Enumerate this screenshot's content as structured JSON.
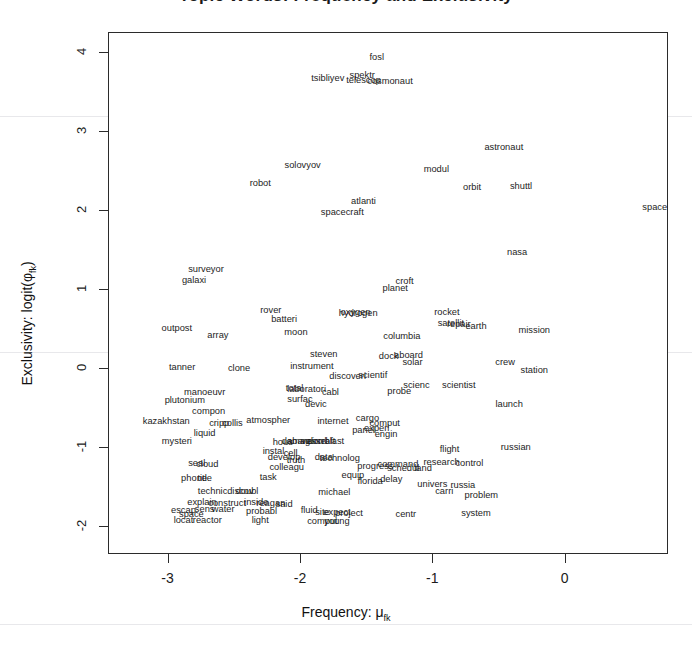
{
  "chart_data": {
    "type": "scatter",
    "title": "Topic Words: Frequency and Exclusivity",
    "xlabel": "Frequency: μ",
    "xlabel_sub": "fk",
    "ylabel": "Exclusivity: logit(φ",
    "ylabel_sub": "fk",
    "ylabel_tail": ")",
    "xlim": [
      -3.45,
      0.78
    ],
    "ylim": [
      -2.35,
      4.25
    ],
    "xticks": [
      "-3",
      "-2",
      "-1",
      "0"
    ],
    "xtick_values": [
      -3,
      -2,
      -1,
      0
    ],
    "yticks": [
      "-2",
      "-1",
      "0",
      "1",
      "2",
      "3",
      "4"
    ],
    "ytick_values": [
      -2,
      -1,
      0,
      1,
      2,
      3,
      4
    ],
    "grid": false,
    "legend": "none",
    "marker": "text-label",
    "points": [
      {
        "label": "fosl",
        "x": -1.42,
        "y": 3.92
      },
      {
        "label": "tsibliyev",
        "x": -1.79,
        "y": 3.65
      },
      {
        "label": "spektr",
        "x": -1.53,
        "y": 3.7
      },
      {
        "label": "telescop",
        "x": -1.52,
        "y": 3.63
      },
      {
        "label": "cosmonaut",
        "x": -1.32,
        "y": 3.62
      },
      {
        "label": "astronaut",
        "x": -0.46,
        "y": 2.78
      },
      {
        "label": "solovyov",
        "x": -1.98,
        "y": 2.55
      },
      {
        "label": "modul",
        "x": -0.97,
        "y": 2.5
      },
      {
        "label": "orbit",
        "x": -0.7,
        "y": 2.28
      },
      {
        "label": "shuttl",
        "x": -0.33,
        "y": 2.29
      },
      {
        "label": "robot",
        "x": -2.3,
        "y": 2.33
      },
      {
        "label": "atlanti",
        "x": -1.52,
        "y": 2.1
      },
      {
        "label": "space",
        "x": 0.68,
        "y": 2.03
      },
      {
        "label": "spacecraft",
        "x": -1.68,
        "y": 1.96
      },
      {
        "label": "nasa",
        "x": -0.36,
        "y": 1.46
      },
      {
        "label": "surveyor",
        "x": -2.71,
        "y": 1.24
      },
      {
        "label": "galaxi",
        "x": -2.8,
        "y": 1.1
      },
      {
        "label": "croft",
        "x": -1.21,
        "y": 1.09
      },
      {
        "label": "planet",
        "x": -1.28,
        "y": 1.0
      },
      {
        "label": "rover",
        "x": -2.22,
        "y": 0.72
      },
      {
        "label": "oxygen",
        "x": -1.58,
        "y": 0.7
      },
      {
        "label": "hydrogen",
        "x": -1.56,
        "y": 0.69
      },
      {
        "label": "rocket",
        "x": -0.89,
        "y": 0.7
      },
      {
        "label": "batteri",
        "x": -2.12,
        "y": 0.61
      },
      {
        "label": "satellit",
        "x": -0.86,
        "y": 0.56
      },
      {
        "label": "repair",
        "x": -0.8,
        "y": 0.55
      },
      {
        "label": "outpost",
        "x": -2.93,
        "y": 0.5
      },
      {
        "label": "earth",
        "x": -0.67,
        "y": 0.52
      },
      {
        "label": "mission",
        "x": -0.23,
        "y": 0.47
      },
      {
        "label": "moon",
        "x": -2.03,
        "y": 0.44
      },
      {
        "label": "array",
        "x": -2.62,
        "y": 0.41
      },
      {
        "label": "columbia",
        "x": -1.23,
        "y": 0.4
      },
      {
        "label": "steven",
        "x": -1.82,
        "y": 0.17
      },
      {
        "label": "dock",
        "x": -1.33,
        "y": 0.14
      },
      {
        "label": "aboard",
        "x": -1.18,
        "y": 0.15
      },
      {
        "label": "solar",
        "x": -1.15,
        "y": 0.06
      },
      {
        "label": "instrument",
        "x": -1.91,
        "y": 0.02
      },
      {
        "label": "crew",
        "x": -0.45,
        "y": 0.07
      },
      {
        "label": "station",
        "x": -0.23,
        "y": -0.03
      },
      {
        "label": "tanner",
        "x": -2.89,
        "y": 0.0
      },
      {
        "label": "clone",
        "x": -2.46,
        "y": -0.01
      },
      {
        "label": "discoveri",
        "x": -1.64,
        "y": -0.11
      },
      {
        "label": "scientif",
        "x": -1.45,
        "y": -0.1
      },
      {
        "label": "scienc",
        "x": -1.12,
        "y": -0.22
      },
      {
        "label": "scientist",
        "x": -0.8,
        "y": -0.22
      },
      {
        "label": "total",
        "x": -2.04,
        "y": -0.27
      },
      {
        "label": "laboratori",
        "x": -1.95,
        "y": -0.28
      },
      {
        "label": "cabl",
        "x": -1.77,
        "y": -0.31
      },
      {
        "label": "probe",
        "x": -1.25,
        "y": -0.3
      },
      {
        "label": "manoeuvr",
        "x": -2.72,
        "y": -0.31
      },
      {
        "label": "plutonium",
        "x": -2.87,
        "y": -0.42
      },
      {
        "label": "surfac",
        "x": -2.0,
        "y": -0.4
      },
      {
        "label": "devic",
        "x": -1.88,
        "y": -0.46
      },
      {
        "label": "launch",
        "x": -0.42,
        "y": -0.47
      },
      {
        "label": "compon",
        "x": -2.69,
        "y": -0.56
      },
      {
        "label": "atmospher",
        "x": -2.24,
        "y": -0.67
      },
      {
        "label": "kazakhstan",
        "x": -3.01,
        "y": -0.68
      },
      {
        "label": "cripp",
        "x": -2.61,
        "y": -0.7
      },
      {
        "label": "collis",
        "x": -2.51,
        "y": -0.7
      },
      {
        "label": "internet",
        "x": -1.75,
        "y": -0.68
      },
      {
        "label": "cargo",
        "x": -1.49,
        "y": -0.64
      },
      {
        "label": "comput",
        "x": -1.36,
        "y": -0.7
      },
      {
        "label": "experi",
        "x": -1.42,
        "y": -0.77
      },
      {
        "label": "panel",
        "x": -1.52,
        "y": -0.8
      },
      {
        "label": "engin",
        "x": -1.35,
        "y": -0.85
      },
      {
        "label": "liquid",
        "x": -2.72,
        "y": -0.83
      },
      {
        "label": "mysteri",
        "x": -2.93,
        "y": -0.94
      },
      {
        "label": "hous",
        "x": -2.13,
        "y": -0.95
      },
      {
        "label": "damag",
        "x": -2.03,
        "y": -0.93
      },
      {
        "label": "abandon",
        "x": -1.96,
        "y": -0.93
      },
      {
        "label": "vessel",
        "x": -1.89,
        "y": -0.93
      },
      {
        "label": "aircraft",
        "x": -1.84,
        "y": -0.94
      },
      {
        "label": "blast",
        "x": -1.74,
        "y": -0.93
      },
      {
        "label": "instal",
        "x": -2.2,
        "y": -1.06
      },
      {
        "label": "cell",
        "x": -2.07,
        "y": -1.08
      },
      {
        "label": "develop",
        "x": -2.12,
        "y": -1.14
      },
      {
        "label": "truth",
        "x": -2.03,
        "y": -1.17
      },
      {
        "label": "data",
        "x": -1.82,
        "y": -1.14
      },
      {
        "label": "technolog",
        "x": -1.7,
        "y": -1.15
      },
      {
        "label": "seal",
        "x": -2.78,
        "y": -1.21
      },
      {
        "label": "cloud",
        "x": -2.7,
        "y": -1.23
      },
      {
        "label": "colleagu",
        "x": -2.1,
        "y": -1.26
      },
      {
        "label": "progress",
        "x": -1.43,
        "y": -1.25
      },
      {
        "label": "command",
        "x": -1.26,
        "y": -1.23
      },
      {
        "label": "schedul",
        "x": -1.22,
        "y": -1.28
      },
      {
        "label": "land",
        "x": -1.07,
        "y": -1.28
      },
      {
        "label": "flight",
        "x": -0.87,
        "y": -1.03
      },
      {
        "label": "russian",
        "x": -0.37,
        "y": -1.01
      },
      {
        "label": "research",
        "x": -0.93,
        "y": -1.2
      },
      {
        "label": "control",
        "x": -0.72,
        "y": -1.21
      },
      {
        "label": "phone",
        "x": -2.8,
        "y": -1.4
      },
      {
        "label": "title",
        "x": -2.72,
        "y": -1.4
      },
      {
        "label": "task",
        "x": -2.24,
        "y": -1.39
      },
      {
        "label": "equip",
        "x": -1.6,
        "y": -1.37
      },
      {
        "label": "florida",
        "x": -1.47,
        "y": -1.44
      },
      {
        "label": "delay",
        "x": -1.31,
        "y": -1.41
      },
      {
        "label": "univers",
        "x": -1.0,
        "y": -1.48
      },
      {
        "label": "carri",
        "x": -0.91,
        "y": -1.57
      },
      {
        "label": "russia",
        "x": -0.77,
        "y": -1.49
      },
      {
        "label": "problem",
        "x": -0.63,
        "y": -1.62
      },
      {
        "label": "technic",
        "x": -2.66,
        "y": -1.56
      },
      {
        "label": "doubl",
        "x": -2.4,
        "y": -1.56
      },
      {
        "label": "discov",
        "x": -2.45,
        "y": -1.57
      },
      {
        "label": "michael",
        "x": -1.74,
        "y": -1.58
      },
      {
        "label": "explain",
        "x": -2.74,
        "y": -1.7
      },
      {
        "label": "construct",
        "x": -2.55,
        "y": -1.72
      },
      {
        "label": "inside",
        "x": -2.33,
        "y": -1.7
      },
      {
        "label": "reagan",
        "x": -2.22,
        "y": -1.72
      },
      {
        "label": "said",
        "x": -2.12,
        "y": -1.73
      },
      {
        "label": "escap",
        "x": -2.88,
        "y": -1.8
      },
      {
        "label": "sens",
        "x": -2.72,
        "y": -1.79
      },
      {
        "label": "water",
        "x": -2.58,
        "y": -1.79
      },
      {
        "label": "fluid",
        "x": -1.93,
        "y": -1.8
      },
      {
        "label": "probabl",
        "x": -2.29,
        "y": -1.82
      },
      {
        "label": "site",
        "x": -1.83,
        "y": -1.83
      },
      {
        "label": "expect",
        "x": -1.72,
        "y": -1.83
      },
      {
        "label": "project",
        "x": -1.63,
        "y": -1.84
      },
      {
        "label": "space2",
        "x": -2.82,
        "y": -1.86
      },
      {
        "label": "system",
        "x": -0.67,
        "y": -1.84
      },
      {
        "label": "centr",
        "x": -1.2,
        "y": -1.86
      },
      {
        "label": "locat",
        "x": -2.88,
        "y": -1.93
      },
      {
        "label": "reactor",
        "x": -2.7,
        "y": -1.93
      },
      {
        "label": "light",
        "x": -2.3,
        "y": -1.93
      },
      {
        "label": "comput2",
        "x": -1.83,
        "y": -1.95
      },
      {
        "label": "young",
        "x": -1.72,
        "y": -1.95
      }
    ]
  }
}
